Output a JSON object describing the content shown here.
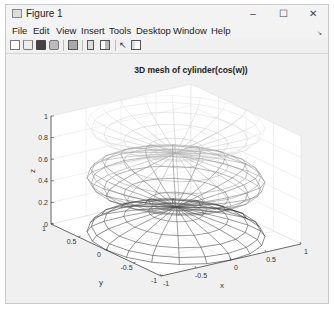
{
  "window": {
    "title": "Figure 1",
    "controls": {
      "minimize": "–",
      "maximize": "☐",
      "close": "✕"
    }
  },
  "menubar": {
    "items": [
      "File",
      "Edit",
      "View",
      "Insert",
      "Tools",
      "Desktop",
      "Window",
      "Help"
    ],
    "overflow_icon": "↘"
  },
  "toolbar": {
    "buttons": [
      "new-figure-icon",
      "open-file-icon",
      "save-icon",
      "print-icon",
      "print-preview-icon",
      "link-plot-icon",
      "insert-colorbar-icon",
      "edit-plot-arrow-icon",
      "property-inspector-icon"
    ]
  },
  "chart_data": {
    "type": "3d-mesh",
    "title": "3D mesh of cylinder(cos(w))",
    "xlabel": "x",
    "ylabel": "y",
    "zlabel": "z",
    "xlim": [
      -1,
      1
    ],
    "ylim": [
      -1,
      1
    ],
    "zlim": [
      0,
      1
    ],
    "xticks": [
      "-1",
      "-0.5",
      "0",
      "0.5",
      "1"
    ],
    "yticks": [
      "-1",
      "-0.5",
      "0",
      "0.5",
      "1"
    ],
    "zticks": [
      "0",
      "0.2",
      "0.4",
      "0.6",
      "0.8",
      "1"
    ],
    "grid": true,
    "surface": "cylinder with radius profile r = cos(w), w from 0 to 2π, mesh (wireframe, no fill shading)",
    "colormap_note": "mesh edges colored by height: dark near z=0, light near z=1"
  }
}
